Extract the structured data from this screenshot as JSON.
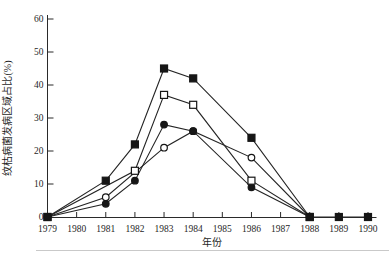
{
  "chart_data": {
    "type": "line",
    "title": "",
    "xlabel": "年份",
    "ylabel": "纹枯病菌发病区域占比(%)",
    "x_ticks": [
      1979,
      1980,
      1981,
      1982,
      1983,
      1984,
      1985,
      1986,
      1987,
      1988,
      1989,
      1990
    ],
    "y_ticks": [
      0,
      10,
      20,
      30,
      40,
      50,
      60
    ],
    "ylim": [
      0,
      60
    ],
    "grid": false,
    "legend": "none",
    "line_color": "#242424",
    "marker_fill_color": "#161616",
    "series": [
      {
        "name": "open-circle",
        "marker": "open-circle",
        "points": [
          [
            1979,
            0
          ],
          [
            1981,
            6
          ],
          [
            1983,
            21
          ],
          [
            1984,
            26
          ],
          [
            1986,
            18
          ],
          [
            1988,
            0
          ]
        ]
      },
      {
        "name": "filled-circle",
        "marker": "filled-circle",
        "points": [
          [
            1979,
            0
          ],
          [
            1981,
            4
          ],
          [
            1982,
            11
          ],
          [
            1983,
            28
          ],
          [
            1984,
            26
          ],
          [
            1986,
            9
          ],
          [
            1988,
            0
          ]
        ]
      },
      {
        "name": "open-square",
        "marker": "open-square",
        "points": [
          [
            1979,
            0
          ],
          [
            1982,
            14
          ],
          [
            1983,
            37
          ],
          [
            1984,
            34
          ],
          [
            1986,
            11
          ],
          [
            1988,
            0
          ]
        ]
      },
      {
        "name": "filled-square",
        "marker": "filled-square",
        "points": [
          [
            1979,
            0
          ],
          [
            1981,
            11
          ],
          [
            1982,
            22
          ],
          [
            1983,
            45
          ],
          [
            1984,
            42
          ],
          [
            1986,
            24
          ],
          [
            1988,
            0
          ],
          [
            1989,
            0
          ],
          [
            1990,
            0
          ]
        ]
      }
    ]
  }
}
